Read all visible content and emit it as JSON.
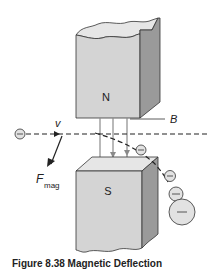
{
  "figure": {
    "caption": "Figure 8.38 Magnetic Deflection",
    "labels": {
      "north_pole": "N",
      "south_pole": "S",
      "field": "B",
      "velocity": "v",
      "force": "F",
      "force_subscript": "mag",
      "charge_sign": "−"
    },
    "colors": {
      "magnet_face": "#d4d4d4",
      "magnet_side": "#9a9a9a",
      "magnet_top": "#e6e6e6",
      "outline": "#333333",
      "field_lines": "#8a8a8a",
      "particle_fill": "#e2e2e2"
    }
  }
}
